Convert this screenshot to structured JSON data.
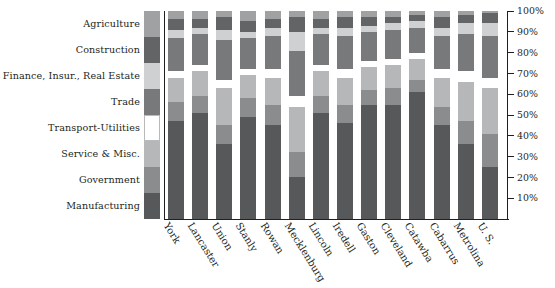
{
  "chart_data": {
    "type": "bar",
    "subtype": "stacked-percentage-bar",
    "title": "",
    "subtitle": "",
    "xlabel": "",
    "ylabel": "",
    "ylim": [
      0,
      100
    ],
    "yunit": "%",
    "grid": false,
    "legend_position": "left",
    "axis_side": "right",
    "categories": [
      "York",
      "Lancaster",
      "Union",
      "Stanly",
      "Rowan",
      "Mecklenburg",
      "Lincoln",
      "Iredell",
      "Gaston",
      "Cleveland",
      "Catawba",
      "Cabarrus",
      "Metrolina",
      "U. S."
    ],
    "ticks": [
      "100%",
      "90%",
      "80%",
      "70%",
      "60%",
      "50%",
      "40%",
      "30%",
      "20%",
      "10%"
    ],
    "tick_values": [
      100,
      90,
      80,
      70,
      60,
      50,
      40,
      30,
      20,
      10
    ],
    "series": [
      {
        "name": "Manufacturing",
        "color": "#57585a",
        "values": [
          47,
          51,
          36,
          49,
          45,
          20,
          51,
          46,
          55,
          55,
          61,
          45,
          36,
          25
        ]
      },
      {
        "name": "Government",
        "color": "#8b8c8e",
        "values": [
          9,
          8,
          9,
          9,
          10,
          12,
          8,
          9,
          7,
          8,
          6,
          9,
          11,
          16
        ]
      },
      {
        "name": "Service & Misc.",
        "color": "#b6b7b9",
        "values": [
          12,
          12,
          18,
          11,
          13,
          22,
          12,
          13,
          11,
          11,
          10,
          14,
          19,
          22
        ]
      },
      {
        "name": "Transport-Utilities",
        "color": "#ffffff",
        "values": [
          3,
          3,
          4,
          3,
          4,
          5,
          3,
          4,
          3,
          3,
          3,
          4,
          5,
          5
        ]
      },
      {
        "name": "Trade",
        "color": "#78797b",
        "values": [
          16,
          15,
          19,
          15,
          16,
          22,
          15,
          16,
          14,
          14,
          12,
          16,
          18,
          20
        ]
      },
      {
        "name": "Finance, Insur., Real Estate",
        "color": "#cfd0d2",
        "values": [
          4,
          3,
          5,
          3,
          4,
          9,
          3,
          4,
          3,
          3,
          3,
          4,
          5,
          6
        ]
      },
      {
        "name": "Construction",
        "color": "#636466",
        "values": [
          5,
          4,
          6,
          5,
          4,
          7,
          4,
          5,
          4,
          3,
          3,
          5,
          4,
          5
        ]
      },
      {
        "name": "Agriculture",
        "color": "#a0a1a3",
        "values": [
          4,
          4,
          3,
          5,
          4,
          3,
          4,
          3,
          3,
          3,
          2,
          3,
          2,
          1
        ]
      }
    ],
    "legend_order_top_to_bottom": [
      "Agriculture",
      "Construction",
      "Finance, Insur., Real Estate",
      "Trade",
      "Transport-Utilities",
      "Service & Misc.",
      "Government",
      "Manufacturing"
    ]
  },
  "colors": {
    "axis": "#231f20",
    "background": "#ffffff",
    "text": "#231f20"
  }
}
